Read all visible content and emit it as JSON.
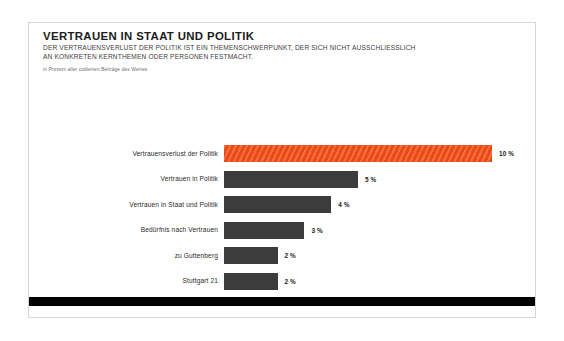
{
  "header": {
    "title": "VERTRAUEN IN STAAT UND POLITIK",
    "subtitle_line1": "DER VERTRAUENSVERLUST DER POLITIK IST EIN THEMENSCHWERPUNKT, DER SICH NICHT AUSSCHLIESSLICH",
    "subtitle_line2": "AN KONKRETEN KERNTHEMEN ODER PERSONEN FESTMACHT.",
    "note": "in Prozent aller codierten Beiträge des Wertes"
  },
  "colors": {
    "highlight": "#f4511a",
    "bar": "#3c3c3c",
    "rule": "#000000",
    "card_border": "#d5d5d5"
  },
  "chart_data": {
    "type": "bar",
    "orientation": "horizontal",
    "title": "VERTRAUEN IN STAAT UND POLITIK",
    "subtitle": "DER VERTRAUENSVERLUST DER POLITIK IST EIN THEMENSCHWERPUNKT, DER SICH NICHT AUSSCHLIESSLICH AN KONKRETEN KERNTHEMEN ODER PERSONEN FESTMACHT.",
    "note": "in Prozent aller codierten Beiträge des Wertes",
    "xlabel": "",
    "ylabel": "",
    "unit": "%",
    "xlim": [
      0,
      10
    ],
    "grid": false,
    "legend": false,
    "categories": [
      "Vertrauensverlust der Politik",
      "Vertrauen in Politik",
      "Vertrauen in Staat und Politik",
      "Bedürfnis nach Vertrauen",
      "zu Guttenberg",
      "Stuttgart 21"
    ],
    "values": [
      10,
      5,
      4,
      3,
      2,
      2
    ],
    "value_labels": [
      "10 %",
      "5 %",
      "4 %",
      "3 %",
      "2 %",
      "2 %"
    ],
    "highlight_index": 0,
    "bars": [
      {
        "label": "Vertrauensverlust der Politik",
        "value": 10,
        "value_label": "10 %",
        "highlight": true
      },
      {
        "label": "Vertrauen in Politik",
        "value": 5,
        "value_label": "5 %",
        "highlight": false
      },
      {
        "label": "Vertrauen in Staat und Politik",
        "value": 4,
        "value_label": "4 %",
        "highlight": false
      },
      {
        "label": "Bedürfnis nach Vertrauen",
        "value": 3,
        "value_label": "3 %",
        "highlight": false
      },
      {
        "label": "zu Guttenberg",
        "value": 2,
        "value_label": "2 %",
        "highlight": false
      },
      {
        "label": "Stuttgart 21",
        "value": 2,
        "value_label": "2 %",
        "highlight": false
      }
    ]
  }
}
